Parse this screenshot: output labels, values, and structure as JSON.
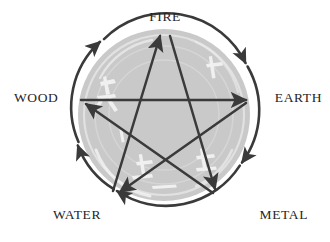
{
  "diagram": {
    "type": "pentagram-cycle",
    "colors": {
      "background": "#ffffff",
      "disc_fill": "#c9c9c9",
      "disc_texture": "#f2f2f2",
      "stroke": "#3a3a3a",
      "label_text": "#252525"
    },
    "geometry": {
      "center_x": 164,
      "center_y": 115,
      "radius": 88,
      "label_radius": 118
    }
  },
  "labels": {
    "fire": "FIRE",
    "wood": "WOOD",
    "earth": "EARTH",
    "water": "WATER",
    "metal": "METAL"
  },
  "nodes": [
    {
      "id": "fire",
      "label": "FIRE",
      "angle_deg": -90,
      "x": 164,
      "y": 27
    },
    {
      "id": "earth",
      "label": "EARTH",
      "angle_deg": -18,
      "x": 248,
      "y": 88
    },
    {
      "id": "metal",
      "label": "METAL",
      "angle_deg": 54,
      "x": 216,
      "y": 186
    },
    {
      "id": "water",
      "label": "WATER",
      "angle_deg": 126,
      "x": 112,
      "y": 186
    },
    {
      "id": "wood",
      "label": "WOOD",
      "angle_deg": 198,
      "x": 80,
      "y": 88
    }
  ],
  "generating_cycle": {
    "name": "outer circle clockwise arrows",
    "direction": "clockwise",
    "arrow_count": 5,
    "sequence": [
      "WOOD",
      "FIRE",
      "EARTH",
      "METAL",
      "WATER",
      "WOOD"
    ]
  },
  "overcoming_cycle": {
    "name": "inner pentagram arrows",
    "arrow_count": 5,
    "edges": [
      {
        "from": "WOOD",
        "to": "EARTH"
      },
      {
        "from": "EARTH",
        "to": "WATER"
      },
      {
        "from": "WATER",
        "to": "FIRE"
      },
      {
        "from": "FIRE",
        "to": "METAL"
      },
      {
        "from": "METAL",
        "to": "WOOD"
      }
    ]
  }
}
